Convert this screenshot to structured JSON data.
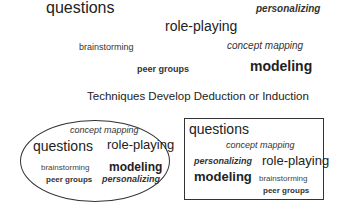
{
  "scatter": {
    "questions": "questions",
    "personalizing": "personalizing",
    "role_playing": "role-playing",
    "brainstorming": "brainstorming",
    "concept_mapping": "concept mapping",
    "peer_groups": "peer groups",
    "modeling": "modeling"
  },
  "caption": "Techniques Develop Deduction or Induction",
  "ellipse_group": {
    "concept_mapping": "concept mapping",
    "questions": "questions",
    "role_playing": "role-playing",
    "brainstorming": "brainstorming",
    "modeling": "modeling",
    "peer_groups": "peer groups",
    "personalizing": "personalizing"
  },
  "box_group": {
    "questions": "questions",
    "concept_mapping": "concept mapping",
    "personalizing": "personalizing",
    "role_playing": "role-playing",
    "modeling": "modeling",
    "brainstorming": "brainstorming",
    "peer_groups": "peer groups"
  }
}
